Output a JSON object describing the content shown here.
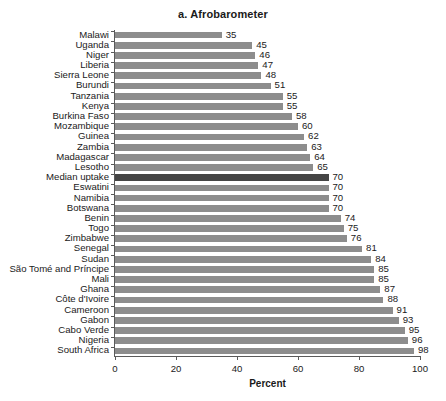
{
  "chart_data": {
    "type": "bar",
    "orientation": "horizontal",
    "title": "a. Afrobarometer",
    "xlabel": "Percent",
    "ylabel": "",
    "xlim": [
      0,
      100
    ],
    "xticks": [
      0,
      20,
      40,
      60,
      80,
      100
    ],
    "grid": false,
    "legend": null,
    "bar_color": "#8d8d8d",
    "highlight_color": "#454545",
    "highlight_category": "Median uptake",
    "categories": [
      "Malawi",
      "Uganda",
      "Niger",
      "Liberia",
      "Sierra Leone",
      "Burundi",
      "Tanzania",
      "Kenya",
      "Burkina Faso",
      "Mozambique",
      "Guinea",
      "Zambia",
      "Madagascar",
      "Lesotho",
      "Median uptake",
      "Eswatini",
      "Namibia",
      "Botswana",
      "Benin",
      "Togo",
      "Zimbabwe",
      "Senegal",
      "Sudan",
      "São Tomé and Príncipe",
      "Mali",
      "Ghana",
      "Côte d'Ivoire",
      "Cameroon",
      "Gabon",
      "Cabo Verde",
      "Nigeria",
      "South Africa"
    ],
    "values": [
      35,
      45,
      46,
      47,
      48,
      51,
      55,
      55,
      58,
      60,
      62,
      63,
      64,
      65,
      70,
      70,
      70,
      70,
      74,
      75,
      76,
      81,
      84,
      85,
      85,
      87,
      88,
      91,
      93,
      95,
      96,
      98
    ]
  }
}
